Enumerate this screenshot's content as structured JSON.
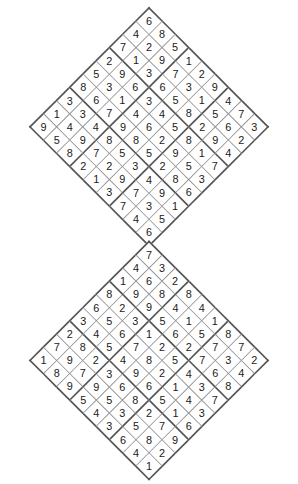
{
  "page": {
    "background_color": "#ffffff",
    "grid_line_color": "#8f8f8f",
    "box_line_color": "#555555",
    "digit_color": "#1a1a1a",
    "rotation_degrees": 45,
    "puzzle_count": 2
  },
  "puzzles": [
    {
      "name": "top-diamond-sudoku",
      "position": "top",
      "size": 9,
      "rows": [
        [
          6,
          8,
          5,
          1,
          2,
          9,
          4,
          7,
          3
        ],
        [
          4,
          2,
          9,
          7,
          3,
          1,
          5,
          6,
          2
        ],
        [
          7,
          1,
          3,
          6,
          5,
          8,
          2,
          9,
          4
        ],
        [
          2,
          9,
          6,
          3,
          4,
          5,
          8,
          1,
          7
        ],
        [
          5,
          3,
          1,
          4,
          6,
          2,
          9,
          5,
          3
        ],
        [
          8,
          6,
          7,
          9,
          8,
          5,
          2,
          8,
          6
        ],
        [
          3,
          3,
          4,
          8,
          5,
          3,
          4,
          9,
          1
        ],
        [
          1,
          4,
          9,
          7,
          2,
          9,
          7,
          3,
          5
        ],
        [
          9,
          5,
          8,
          2,
          1,
          3,
          7,
          4,
          6
        ]
      ]
    },
    {
      "name": "bottom-diamond-sudoku",
      "position": "bottom",
      "size": 9,
      "rows": [
        [
          7,
          3,
          2,
          8,
          4,
          1,
          8,
          7,
          2
        ],
        [
          4,
          6,
          8,
          4,
          1,
          5,
          7,
          3,
          4
        ],
        [
          1,
          9,
          9,
          5,
          6,
          2,
          7,
          6,
          8
        ],
        [
          8,
          2,
          3,
          1,
          2,
          5,
          4,
          3,
          7
        ],
        [
          6,
          5,
          6,
          7,
          8,
          2,
          1,
          4,
          3
        ],
        [
          3,
          4,
          5,
          4,
          9,
          6,
          5,
          1,
          6
        ],
        [
          2,
          8,
          2,
          3,
          6,
          8,
          2,
          7,
          9
        ],
        [
          7,
          9,
          7,
          9,
          5,
          3,
          5,
          8,
          2
        ],
        [
          1,
          8,
          9,
          5,
          4,
          3,
          6,
          4,
          1
        ]
      ]
    }
  ]
}
